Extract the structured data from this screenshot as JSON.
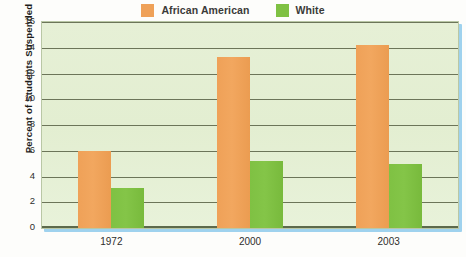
{
  "chart_data": {
    "type": "bar",
    "title": "",
    "xlabel": "",
    "ylabel": "Percent of Students Suspended",
    "categories": [
      "1972",
      "2000",
      "2003"
    ],
    "series": [
      {
        "name": "African American",
        "color": "#EFA158",
        "values": [
          6.0,
          13.3,
          14.2
        ]
      },
      {
        "name": "White",
        "color": "#7FC143",
        "values": [
          3.1,
          5.2,
          5.0
        ]
      }
    ],
    "ylim": [
      0,
      16
    ],
    "ytick_step": 2,
    "yticks": [
      "0",
      "2",
      "4",
      "6",
      "8",
      "10",
      "12",
      "14",
      "16"
    ],
    "grid": true,
    "legend_position": "top-center",
    "plot_background": "#E3EED1",
    "gridline_color": "#6C7559",
    "shadow_color": "#9FD2EE"
  },
  "legend": {
    "entries": [
      {
        "label": "African American",
        "swatch": "#EFA158"
      },
      {
        "label": "White",
        "swatch": "#7FC143"
      }
    ]
  }
}
